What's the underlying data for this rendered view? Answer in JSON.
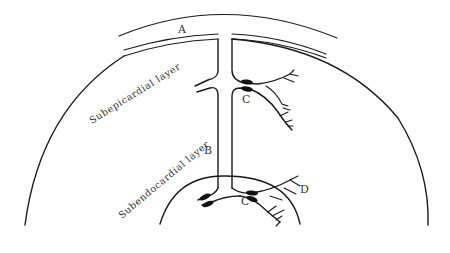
{
  "diagram": {
    "title": "",
    "labels": {
      "A": "A",
      "B": "B",
      "C_upper": "C",
      "C_lower": "C",
      "D": "D"
    },
    "layers": {
      "subepicardial": "Subepicardial layer",
      "subendocardial": "Subendocardial layer"
    },
    "colors": {
      "line": "#1a1a1a",
      "text": "#333333",
      "background": "#ffffff"
    }
  }
}
